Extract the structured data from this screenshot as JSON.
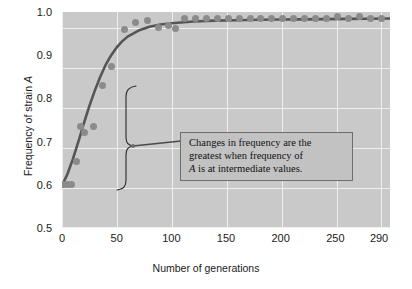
{
  "figure": {
    "background_color": "#ffffff",
    "panel_color": "#c9c9c9",
    "gridline_color": "#efefef",
    "point_color": "#8b8b8b",
    "curve_color": "#555555"
  },
  "axes": {
    "y_title_prefix": "Frequency of strain ",
    "y_title_italic": "A",
    "x_title": "Number of generations"
  },
  "annotation": {
    "line1": "Changes in frequency are the",
    "line2": "greatest when frequency of",
    "line3_italic": "A",
    "line3_rest": " is at intermediate values."
  },
  "chart_data": {
    "type": "scatter",
    "title": "",
    "xlabel": "Number of generations",
    "ylabel": "Frequency of strain A",
    "xlim": [
      0,
      300
    ],
    "ylim": [
      0.5,
      1.0
    ],
    "xticks": [
      0,
      50,
      100,
      150,
      200,
      250,
      290
    ],
    "xtick_labels": [
      "0",
      "50",
      "100",
      "150",
      "200",
      "250",
      "290"
    ],
    "yticks": [
      0.5,
      0.6,
      0.7,
      0.8,
      0.9,
      1.0
    ],
    "ytick_labels": [
      "0.5",
      "0.6",
      "0.7",
      "0.8",
      "0.9",
      "1.0"
    ],
    "grid": true,
    "legend": false,
    "series": [
      {
        "name": "observed frequency of strain A",
        "marker": "circle",
        "color": "#8b8b8b",
        "x": [
          1,
          5,
          9,
          13,
          17,
          21,
          29,
          37,
          45,
          57,
          67,
          78,
          88,
          97,
          104,
          112,
          122,
          132,
          142,
          152,
          162,
          172,
          182,
          192,
          202,
          212,
          222,
          232,
          242,
          252,
          262,
          272,
          282,
          292
        ],
        "y": [
          0.6,
          0.6,
          0.6,
          0.655,
          0.735,
          0.72,
          0.735,
          0.83,
          0.875,
          0.96,
          0.975,
          0.98,
          0.965,
          0.968,
          0.962,
          0.985,
          0.985,
          0.985,
          0.985,
          0.985,
          0.985,
          0.985,
          0.985,
          0.985,
          0.985,
          0.985,
          0.985,
          0.985,
          0.985,
          0.99,
          0.985,
          0.99,
          0.985,
          0.985
        ]
      },
      {
        "name": "fitted logistic curve",
        "marker": "line",
        "color": "#555555",
        "x": [
          0,
          5,
          10,
          15,
          20,
          25,
          30,
          35,
          40,
          45,
          50,
          55,
          60,
          70,
          80,
          90,
          100,
          120,
          140,
          160,
          180,
          200,
          220,
          240,
          260,
          280,
          300
        ],
        "y": [
          0.598,
          0.625,
          0.66,
          0.7,
          0.742,
          0.782,
          0.818,
          0.85,
          0.878,
          0.9,
          0.918,
          0.932,
          0.943,
          0.957,
          0.966,
          0.971,
          0.974,
          0.978,
          0.98,
          0.981,
          0.982,
          0.9825,
          0.983,
          0.9835,
          0.984,
          0.9845,
          0.985
        ]
      }
    ],
    "annotations": [
      {
        "text": "Changes in frequency are the greatest when frequency of A is at intermediate values.",
        "points_to_x_range": [
          20,
          60
        ],
        "points_to_y_range": [
          0.66,
          0.9
        ]
      }
    ]
  }
}
